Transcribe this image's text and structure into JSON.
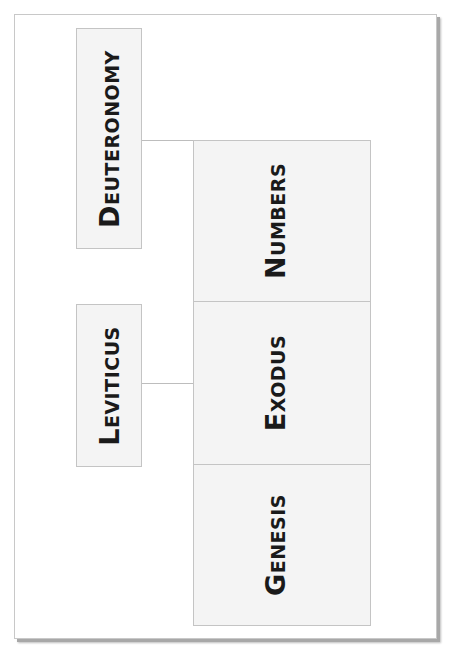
{
  "diagram": {
    "title": "",
    "left_column": [
      {
        "id": "deuteronomy",
        "cap": "D",
        "rest": "EUTERONOMY",
        "label": "Deuteronomy"
      },
      {
        "id": "leviticus",
        "cap": "L",
        "rest": "EVITICUS",
        "label": "Leviticus"
      }
    ],
    "right_column": [
      {
        "id": "numbers",
        "cap": "N",
        "rest": "UMBERS",
        "label": "Numbers"
      },
      {
        "id": "exodus",
        "cap": "E",
        "rest": "XODUS",
        "label": "Exodus"
      },
      {
        "id": "genesis",
        "cap": "G",
        "rest": "ENESIS",
        "label": "Genesis"
      }
    ],
    "connections": [
      {
        "from": "deuteronomy",
        "to": "numbers"
      },
      {
        "from": "leviticus",
        "to": "exodus"
      }
    ],
    "colors": {
      "box_fill": "#f4f4f4",
      "box_border": "#c4c4c4",
      "text": "#1a1a1a",
      "page_shadow": "#a8a8a8"
    }
  }
}
